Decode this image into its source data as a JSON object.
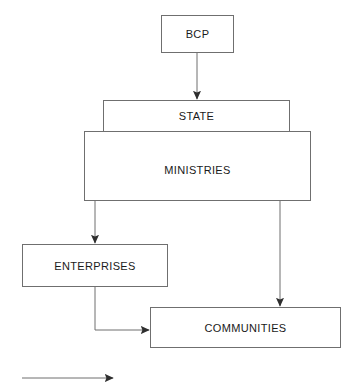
{
  "diagram": {
    "title": "Relations of Dominance and Control",
    "type": "hierarchy-flowchart",
    "stroke_color": "#6f6f6f",
    "arrow_color": "#4a4a4a",
    "text_color": "#1a1a1a",
    "background_color": "#ffffff",
    "nodes": [
      {
        "id": "bcp",
        "label": "BCP"
      },
      {
        "id": "state",
        "label": "STATE"
      },
      {
        "id": "ministries",
        "label": "MINISTRIES"
      },
      {
        "id": "enterprises",
        "label": "ENTERPRISES"
      },
      {
        "id": "communities",
        "label": "COMMUNITIES"
      }
    ],
    "edges": [
      {
        "from": "bcp",
        "to": "state",
        "kind": "dominance-and-control"
      },
      {
        "from": "ministries",
        "to": "enterprises",
        "kind": "dominance-and-control"
      },
      {
        "from": "ministries",
        "to": "communities",
        "kind": "dominance-and-control"
      },
      {
        "from": "enterprises",
        "to": "communities",
        "kind": "dominance-and-control"
      }
    ],
    "legend": {
      "arrow_label": "Relations of Dominance and Control",
      "arrow_icon": "arrow-right-icon"
    }
  }
}
